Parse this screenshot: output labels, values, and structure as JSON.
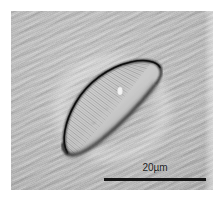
{
  "figure": {
    "kind": "light-micrograph",
    "background_color": "#b9b9b9",
    "page_color": "#ffffff",
    "outline_color": "#1c1c1c"
  },
  "scalebar": {
    "label": "20µm",
    "length_um": 20,
    "bar_color": "#141414"
  },
  "specimen": {
    "stigma_label": "stigma",
    "striae_count": 46,
    "dorsal_margin_label": "dorsal-margin",
    "ventral_margin_label": "ventral-margin"
  }
}
